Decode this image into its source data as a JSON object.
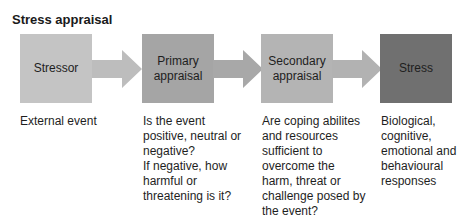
{
  "title": "Stress appraisal",
  "stages": [
    {
      "label": "Stressor",
      "color": "#c4c4c4",
      "description": "External event"
    },
    {
      "label": "Primary\nappraisal",
      "color": "#a5a5a5",
      "description": "Is the event\npositive, neutral or\nnegative?\nIf negative, how\nharmful or\nthreatening is it?"
    },
    {
      "label": "Secondary\nappraisal",
      "color": "#b4b4b4",
      "description": "Are coping abilites\nand resources\nsufficient to\novercome the\nharm, threat or\nchallenge posed by\nthe event?"
    },
    {
      "label": "Stress",
      "color": "#707070",
      "description": "Biological,\ncognitive,\nemotional and\nbehavioural\nresponses"
    }
  ],
  "arrow_color": "#bdbdbd"
}
